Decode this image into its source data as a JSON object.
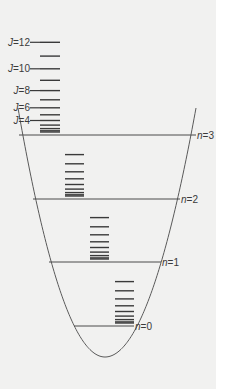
{
  "diagram": {
    "type": "energy-level-diagram",
    "colors": {
      "background": "#f1f1f0",
      "lines": "#4a4a4a",
      "levels": "#3a3a3a",
      "text": "#3a3a3a"
    },
    "vibrational_levels": [
      {
        "n": 0,
        "label": "n=0",
        "y": 326,
        "x_left": 74,
        "x_right": 134
      },
      {
        "n": 1,
        "label": "n=1",
        "y": 262,
        "x_left": 49,
        "x_right": 161
      },
      {
        "n": 2,
        "label": "n=2",
        "y": 199,
        "x_left": 33,
        "x_right": 180
      },
      {
        "n": 3,
        "label": "n=3",
        "y": 135,
        "x_left": 19,
        "x_right": 196
      }
    ],
    "rotational_ladders": [
      {
        "base_n": 3,
        "x": 40,
        "width": 20,
        "j_max": 12
      },
      {
        "base_n": 2,
        "x": 65,
        "width": 19,
        "j_max": 8
      },
      {
        "base_n": 1,
        "x": 90,
        "width": 19,
        "j_max": 8
      },
      {
        "base_n": 0,
        "x": 115,
        "width": 19,
        "j_max": 8
      }
    ],
    "j_labels": [
      {
        "text": "J=12",
        "j": 12
      },
      {
        "text": "J=10",
        "j": 10
      },
      {
        "text": "J=8",
        "j": 8
      },
      {
        "text": "J=6",
        "j": 6
      },
      {
        "text": "J=4",
        "j": 4
      }
    ],
    "rotational_scale_px_per_unit": 0.575,
    "potential_well": {
      "vertex_x": 105,
      "vertex_y": 357,
      "left_top": [
        18,
        108
      ],
      "right_top": [
        196,
        108
      ]
    }
  }
}
